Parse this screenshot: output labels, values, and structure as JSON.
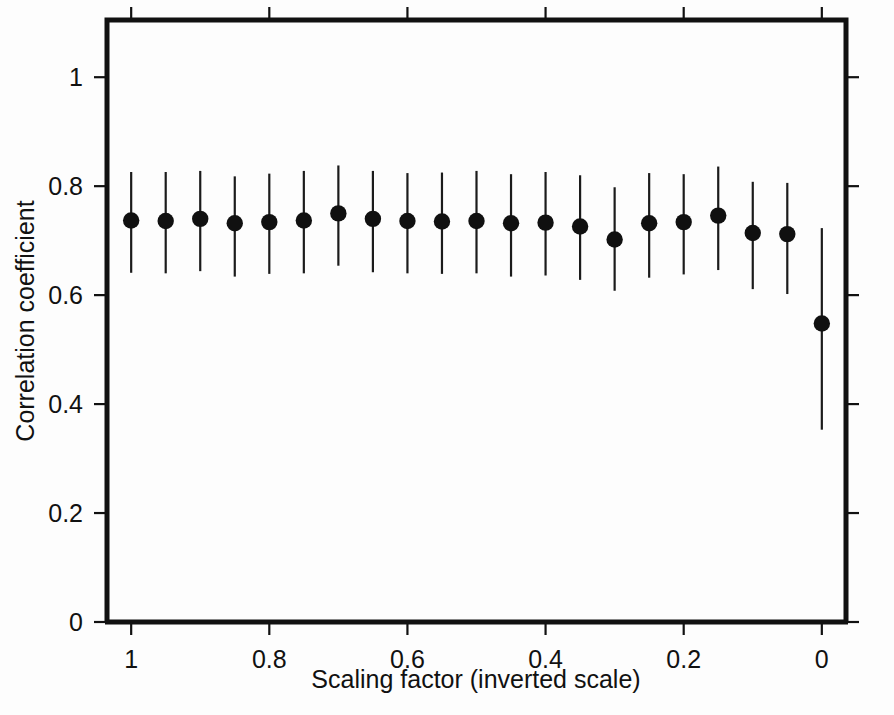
{
  "figure": {
    "background_color": "#fdfdfd",
    "frame_color": "#111111",
    "marker_color": "#101010",
    "errorbar_color": "#1b1b1b"
  },
  "axis": {
    "x_title": "Scaling factor (inverted scale)",
    "y_title": "Correlation coefficient",
    "x_tick_labels": [
      "1",
      "0.8",
      "0.6",
      "0.4",
      "0.2",
      "0"
    ],
    "x_tick_values": [
      1,
      0.8,
      0.6,
      0.4,
      0.2,
      0
    ],
    "y_tick_labels": [
      "0",
      "0.2",
      "0.4",
      "0.6",
      "0.8",
      "1"
    ],
    "y_tick_values": [
      0,
      0.2,
      0.4,
      0.6,
      0.8,
      1
    ]
  },
  "chart_data": {
    "type": "scatter",
    "title": "",
    "subtitle": "",
    "xlabel": "Scaling factor (inverted scale)",
    "ylabel": "Correlation coefficient",
    "xlim": [
      1.035,
      -0.035
    ],
    "ylim": [
      0,
      1.105
    ],
    "x_inverted": true,
    "grid": false,
    "legend": null,
    "errorbars": "vertical",
    "x": [
      1.0,
      0.95,
      0.9,
      0.85,
      0.8,
      0.75,
      0.7,
      0.65,
      0.6,
      0.55,
      0.5,
      0.45,
      0.4,
      0.35,
      0.3,
      0.25,
      0.2,
      0.15,
      0.1,
      0.05,
      0.0
    ],
    "values": [
      0.737,
      0.736,
      0.74,
      0.732,
      0.734,
      0.737,
      0.75,
      0.74,
      0.736,
      0.735,
      0.736,
      0.732,
      0.733,
      0.726,
      0.702,
      0.732,
      0.734,
      0.746,
      0.714,
      0.712,
      0.548
    ],
    "y_upper": [
      0.826,
      0.826,
      0.828,
      0.818,
      0.823,
      0.828,
      0.838,
      0.828,
      0.824,
      0.825,
      0.828,
      0.822,
      0.826,
      0.82,
      0.798,
      0.824,
      0.822,
      0.836,
      0.808,
      0.806,
      0.723
    ],
    "y_lower": [
      0.641,
      0.64,
      0.644,
      0.634,
      0.639,
      0.64,
      0.654,
      0.642,
      0.64,
      0.639,
      0.64,
      0.634,
      0.636,
      0.628,
      0.608,
      0.632,
      0.638,
      0.646,
      0.611,
      0.602,
      0.353
    ],
    "series": [
      {
        "name": "Correlation coefficient",
        "values": [
          0.737,
          0.736,
          0.74,
          0.732,
          0.734,
          0.737,
          0.75,
          0.74,
          0.736,
          0.735,
          0.736,
          0.732,
          0.733,
          0.726,
          0.702,
          0.732,
          0.734,
          0.746,
          0.714,
          0.712,
          0.548
        ]
      }
    ]
  }
}
